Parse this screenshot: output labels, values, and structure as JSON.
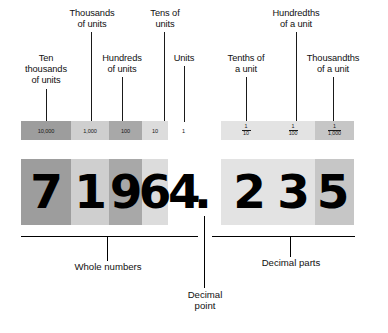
{
  "figure": {
    "number_displayed": "71964.235",
    "background_color": "#ffffff",
    "line_color": "#1a1a1a"
  },
  "top_labels": {
    "ten_thousands": "Ten\nthousands\nof units",
    "thousands": "Thousands\nof units",
    "hundreds": "Hundreds\nof units",
    "tens": "Tens of\nunits",
    "units": "Units",
    "tenths": "Tenths of\na unit",
    "hundredths": "Hundredths\nof a unit",
    "thousandths": "Thousandths\nof a unit"
  },
  "whole_bar": {
    "cells": [
      {
        "label": "10,000",
        "color": "#9d9d9d"
      },
      {
        "label": "1,000",
        "color": "#cfcfcf"
      },
      {
        "label": "100",
        "color": "#a8a8a8"
      },
      {
        "label": "10",
        "color": "#dcdcdc"
      }
    ]
  },
  "units_cell": {
    "label": "1",
    "color": "#ffffff"
  },
  "decimal_bar": {
    "cells": [
      {
        "numerator": "1",
        "denominator": "10",
        "color": "#e3e3e3"
      },
      {
        "numerator": "1",
        "denominator": "100",
        "color": "#e3e3e3"
      },
      {
        "numerator": "1",
        "denominator": "1,000",
        "color": "#c6c6c6"
      }
    ]
  },
  "number_row": {
    "whole_digits": [
      {
        "digit": "7",
        "color": "#9d9d9d"
      },
      {
        "digit": "1",
        "color": "#cfcfcf"
      },
      {
        "digit": "9",
        "color": "#a8a8a8"
      },
      {
        "digit": "6",
        "color": "#dcdcdc"
      }
    ],
    "units_digit": {
      "digit": "4",
      "color": "#ffffff"
    },
    "decimal_point": ".",
    "decimal_digits": [
      {
        "digit": "2",
        "color": "#e3e3e3"
      },
      {
        "digit": "3",
        "color": "#e3e3e3"
      },
      {
        "digit": "5",
        "color": "#c6c6c6"
      }
    ]
  },
  "bottom_labels": {
    "whole_numbers": "Whole numbers",
    "decimal_point": "Decimal\npoint",
    "decimal_parts": "Decimal parts"
  }
}
